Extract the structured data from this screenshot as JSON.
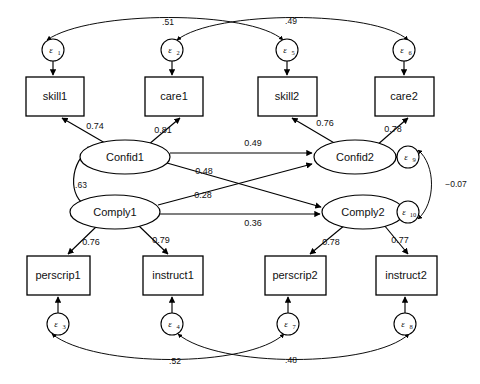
{
  "diagram": {
    "type": "sem-path-diagram",
    "background_color": "#ffffff",
    "stroke_color": "#000000"
  },
  "latent_variables": [
    {
      "id": "confid1",
      "label": "Confid1",
      "cx": 125,
      "cy": 157,
      "rx": 45,
      "ry": 17
    },
    {
      "id": "confid2",
      "label": "Confid2",
      "cx": 355,
      "cy": 157,
      "rx": 41,
      "ry": 17
    },
    {
      "id": "comply1",
      "label": "Comply1",
      "cx": 115,
      "cy": 212,
      "rx": 45,
      "ry": 17
    },
    {
      "id": "comply2",
      "label": "Comply2",
      "cx": 363,
      "cy": 212,
      "rx": 41,
      "ry": 17
    }
  ],
  "observed_variables": [
    {
      "id": "skill1",
      "label": "skill1",
      "x": 26,
      "y": 77,
      "w": 58,
      "h": 39
    },
    {
      "id": "care1",
      "label": "care1",
      "x": 145,
      "y": 77,
      "w": 58,
      "h": 39
    },
    {
      "id": "skill2",
      "label": "skill2",
      "x": 258,
      "y": 77,
      "w": 59,
      "h": 39
    },
    {
      "id": "care2",
      "label": "care2",
      "x": 375,
      "y": 77,
      "w": 59,
      "h": 39
    },
    {
      "id": "perscrip1",
      "label": "perscrip1",
      "x": 27,
      "y": 256,
      "w": 63,
      "h": 39
    },
    {
      "id": "instruct1",
      "label": "instruct1",
      "x": 143,
      "y": 256,
      "w": 60,
      "h": 39
    },
    {
      "id": "perscrip2",
      "label": "perscrip2",
      "x": 265,
      "y": 256,
      "w": 61,
      "h": 39
    },
    {
      "id": "instruct2",
      "label": "instruct2",
      "x": 376,
      "y": 256,
      "w": 61,
      "h": 39
    }
  ],
  "error_terms": [
    {
      "id": "e1",
      "label": "ε",
      "sub": "1",
      "cx": 53,
      "cy": 50,
      "r": 11
    },
    {
      "id": "e2",
      "label": "ε",
      "sub": "2",
      "cx": 172,
      "cy": 50,
      "r": 11
    },
    {
      "id": "e5",
      "label": "ε",
      "sub": "5",
      "cx": 287,
      "cy": 50,
      "r": 11
    },
    {
      "id": "e6",
      "label": "ε",
      "sub": "6",
      "cx": 404,
      "cy": 50,
      "r": 11
    },
    {
      "id": "e3",
      "label": "ε",
      "sub": "3",
      "cx": 58,
      "cy": 324,
      "r": 11
    },
    {
      "id": "e4",
      "label": "ε",
      "sub": "4",
      "cx": 172,
      "cy": 324,
      "r": 11
    },
    {
      "id": "e7",
      "label": "ε",
      "sub": "7",
      "cx": 288,
      "cy": 324,
      "r": 11
    },
    {
      "id": "e8",
      "label": "ε",
      "sub": "8",
      "cx": 405,
      "cy": 324,
      "r": 11
    },
    {
      "id": "e9",
      "label": "ε",
      "sub": "9",
      "cx": 408,
      "cy": 157,
      "r": 11
    },
    {
      "id": "e10",
      "label": "ε",
      "sub": "10",
      "cx": 408,
      "cy": 212,
      "r": 11
    }
  ],
  "loadings": [
    {
      "id": "confid1-skill1",
      "from": "confid1",
      "to": "skill1",
      "value": "0.74",
      "lx": 95,
      "ly": 127
    },
    {
      "id": "confid1-care1",
      "from": "confid1",
      "to": "care1",
      "value": "0.81",
      "lx": 163,
      "ly": 131
    },
    {
      "id": "confid2-skill2",
      "from": "confid2",
      "to": "skill2",
      "value": "0.76",
      "lx": 325,
      "ly": 124
    },
    {
      "id": "confid2-care2",
      "from": "confid2",
      "to": "care2",
      "value": "0.78",
      "lx": 393,
      "ly": 130
    },
    {
      "id": "comply1-perscrip1",
      "from": "comply1",
      "to": "perscrip1",
      "value": "0.76",
      "lx": 91,
      "ly": 243
    },
    {
      "id": "comply1-instruct1",
      "from": "comply1",
      "to": "instruct1",
      "value": "0.79",
      "lx": 161,
      "ly": 241
    },
    {
      "id": "comply2-perscrip2",
      "from": "comply2",
      "to": "perscrip2",
      "value": "0.78",
      "lx": 331,
      "ly": 243
    },
    {
      "id": "comply2-instruct2",
      "from": "comply2",
      "to": "instruct2",
      "value": "0.77",
      "lx": 400,
      "ly": 241
    }
  ],
  "structural_paths": [
    {
      "id": "confid1-confid2",
      "from": "Confid1",
      "to": "Confid2",
      "value": "0.49",
      "lx": 253,
      "ly": 158
    },
    {
      "id": "confid1-comply2",
      "from": "Confid1",
      "to": "Comply2",
      "value": "0.48",
      "lx": 204,
      "ly": 174
    },
    {
      "id": "comply1-confid2",
      "from": "Comply1",
      "to": "Confid2",
      "value": "0.28",
      "lx": 203,
      "ly": 198
    },
    {
      "id": "comply1-comply2",
      "from": "Comply1",
      "to": "Comply2",
      "value": "0.36",
      "lx": 253,
      "ly": 213
    }
  ],
  "covariances": [
    {
      "id": "confid1-comply1",
      "between": [
        "Confid1",
        "Comply1"
      ],
      "value": ".63",
      "lx": 81,
      "ly": 186
    },
    {
      "id": "e1-e5",
      "between": [
        "ε1",
        "ε5"
      ],
      "value": ".51",
      "lx": 168,
      "ly": 23
    },
    {
      "id": "e2-e6",
      "between": [
        "ε2",
        "ε6"
      ],
      "value": ".49",
      "lx": 291,
      "ly": 22
    },
    {
      "id": "e3-e7",
      "between": [
        "ε3",
        "ε7"
      ],
      "value": ".52",
      "lx": 175,
      "ly": 362
    },
    {
      "id": "e4-e8",
      "between": [
        "ε4",
        "ε8"
      ],
      "value": ".48",
      "lx": 291,
      "ly": 361
    },
    {
      "id": "e9-e10",
      "between": [
        "ε9",
        "ε10"
      ],
      "value": "−0.07",
      "lx": 456,
      "ly": 185
    }
  ]
}
